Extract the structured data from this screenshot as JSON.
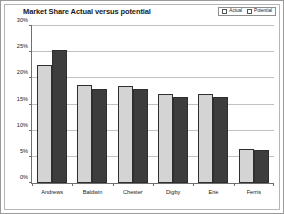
{
  "chart_data": {
    "type": "bar",
    "title": "Market Share Actual versus potential",
    "xlabel": "",
    "ylabel": "",
    "ylim": [
      0,
      30
    ],
    "ytick_labels": [
      "0%",
      "5%",
      "10%",
      "15%",
      "20%",
      "25%",
      "30%"
    ],
    "ytick_values": [
      0,
      5,
      10,
      15,
      20,
      25,
      30
    ],
    "grid": true,
    "legend_position": "top-right",
    "categories": [
      "Andrews",
      "Baldwin",
      "Chester",
      "Digby",
      "Erie",
      "Ferris"
    ],
    "series": [
      {
        "name": "Actual",
        "color": "#d4d4d4",
        "values": [
          22.5,
          18.8,
          18.5,
          17.0,
          17.0,
          6.5
        ]
      },
      {
        "name": "Potential",
        "color": "#3d3d3d",
        "values": [
          25.5,
          18.0,
          18.0,
          16.5,
          16.5,
          6.3
        ]
      }
    ]
  },
  "legend": {
    "entries": [
      {
        "label": "Actual"
      },
      {
        "label": "Potential"
      }
    ]
  }
}
